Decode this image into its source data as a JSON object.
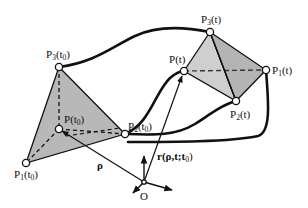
{
  "diagram": {
    "type": "kinematics-schematic",
    "colors": {
      "stroke": "#111111",
      "fill_initial": "#b8b8b8",
      "fill_current_left": "#cfcfcf",
      "fill_current_right": "#b4b4b4",
      "node_fill": "#ffffff"
    },
    "initial_tetrahedron": {
      "P3": {
        "base": "P",
        "sub": "3",
        "arg": "t",
        "argsub": "0"
      },
      "P": {
        "base": "P",
        "sub": "",
        "arg": "t",
        "argsub": "0"
      },
      "P2": {
        "base": "P",
        "sub": "2",
        "arg": "t",
        "argsub": "0"
      },
      "P1": {
        "base": "P",
        "sub": "1",
        "arg": "t",
        "argsub": "0"
      }
    },
    "current_tetrahedron": {
      "P3": {
        "base": "P",
        "sub": "3",
        "arg": "t"
      },
      "P": {
        "base": "P",
        "sub": "",
        "arg": "t"
      },
      "P1": {
        "base": "P",
        "sub": "1",
        "arg": "t"
      },
      "P2": {
        "base": "P",
        "sub": "2",
        "arg": "t"
      }
    },
    "vectors": {
      "rho": "ρ",
      "r": {
        "main": "r(ρ,t;t",
        "sub": "0",
        "close": ")"
      }
    },
    "origin": "O"
  }
}
